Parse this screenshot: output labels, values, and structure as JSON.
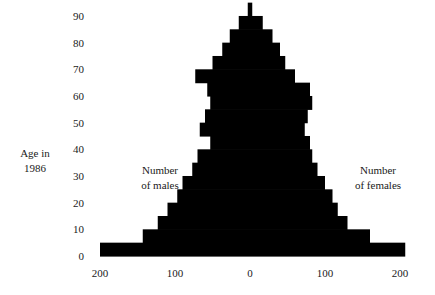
{
  "axis_title": {
    "line1": "Age in",
    "line2": "1986"
  },
  "annotations": {
    "left": {
      "line1": "Number",
      "line2": "of males"
    },
    "right": {
      "line1": "Number",
      "line2": "of females"
    }
  },
  "y_ticks": [
    "90",
    "80",
    "70",
    "60",
    "50",
    "40",
    "30",
    "20",
    "10",
    "0"
  ],
  "x_ticks": [
    "200",
    "100",
    "0",
    "100",
    "200"
  ],
  "chart_data": {
    "type": "bar",
    "subtype": "population-pyramid",
    "orientation": "horizontal",
    "title": "",
    "xlabel": "",
    "ylabel": "Age in 1986",
    "xlim": [
      -220,
      220
    ],
    "ylim": [
      0,
      95
    ],
    "grid": false,
    "legend": false,
    "bar_color": "#000000",
    "x_tick_values": [
      -200,
      -100,
      0,
      100,
      200
    ],
    "x_tick_labels": [
      "200",
      "100",
      "0",
      "100",
      "200"
    ],
    "y_tick_values": [
      0,
      10,
      20,
      30,
      40,
      50,
      60,
      70,
      80,
      90
    ],
    "y_tick_labels": [
      "0",
      "10",
      "20",
      "30",
      "40",
      "50",
      "60",
      "70",
      "80",
      "90"
    ],
    "categories": [
      "0-4",
      "5-9",
      "10-14",
      "15-19",
      "20-24",
      "25-29",
      "30-34",
      "35-39",
      "40-44",
      "45-49",
      "50-54",
      "55-59",
      "60-64",
      "65-69",
      "70-74",
      "75-79",
      "80-84",
      "85-89",
      "90+"
    ],
    "age_starts": [
      0,
      5,
      10,
      15,
      20,
      25,
      30,
      35,
      40,
      45,
      50,
      55,
      60,
      65,
      70,
      75,
      80,
      85,
      90
    ],
    "series": [
      {
        "name": "Number of males",
        "side": "left",
        "values": [
          200,
          143,
          123,
          110,
          97,
          90,
          77,
          70,
          53,
          67,
          60,
          53,
          57,
          73,
          50,
          37,
          27,
          15,
          3
        ]
      },
      {
        "name": "Number of females",
        "side": "right",
        "values": [
          207,
          160,
          130,
          117,
          110,
          100,
          90,
          83,
          80,
          73,
          77,
          83,
          80,
          60,
          47,
          40,
          30,
          17,
          3
        ]
      }
    ]
  }
}
